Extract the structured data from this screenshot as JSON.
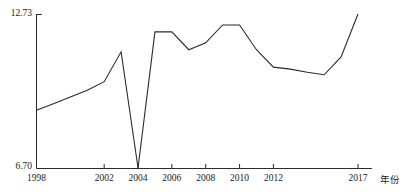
{
  "chart_data": {
    "type": "line",
    "title": "",
    "xlabel": "年份",
    "ylabel": "",
    "grid": false,
    "legend": false,
    "ylim": [
      6.7,
      12.73
    ],
    "xlim": [
      1998,
      2017
    ],
    "y_tick_labels": [
      "12.73",
      "6.70"
    ],
    "y_ticks": [
      12.73,
      6.7
    ],
    "x_tick_labels": [
      "1998",
      "2002",
      "2004",
      "2006",
      "2008",
      "2010",
      "2012",
      "2017"
    ],
    "x_ticks": [
      1998,
      2002,
      2004,
      2006,
      2008,
      2010,
      2012,
      2017
    ],
    "line_color": "#2b2b2b",
    "x": [
      1998,
      1999,
      2000,
      2001,
      2002,
      2003,
      2004,
      2005,
      2006,
      2007,
      2008,
      2009,
      2010,
      2011,
      2012,
      2013,
      2014,
      2015,
      2016,
      2017
    ],
    "values": [
      8.96,
      9.22,
      9.48,
      9.74,
      10.08,
      11.25,
      6.7,
      12.03,
      12.03,
      11.33,
      11.6,
      12.3,
      12.3,
      11.33,
      10.65,
      10.57,
      10.45,
      10.35,
      11.05,
      12.73
    ],
    "series": [
      {
        "name": "series-1",
        "values": [
          8.96,
          9.22,
          9.48,
          9.74,
          10.08,
          11.25,
          6.7,
          12.03,
          12.03,
          11.33,
          11.6,
          12.3,
          12.3,
          11.33,
          10.65,
          10.57,
          10.45,
          10.35,
          11.05,
          12.73
        ]
      }
    ]
  },
  "axes": {
    "y_max_label": "12.73",
    "y_min_label": "6.70",
    "x_axis_title": "年份"
  },
  "x_tick_display": [
    {
      "label": "1998",
      "value": 1998
    },
    {
      "label": "2002",
      "value": 2002
    },
    {
      "label": "2004",
      "value": 2004
    },
    {
      "label": "2006",
      "value": 2006
    },
    {
      "label": "2008",
      "value": 2008
    },
    {
      "label": "2010",
      "value": 2010
    },
    {
      "label": "2012",
      "value": 2012
    },
    {
      "label": "2017",
      "value": 2017
    }
  ]
}
